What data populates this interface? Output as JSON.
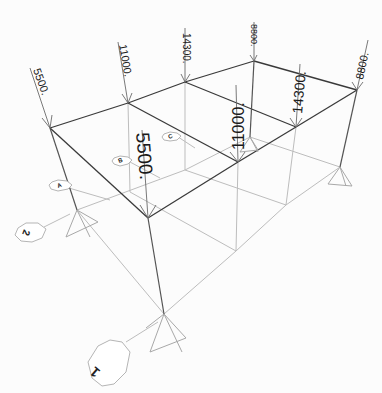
{
  "diagram": {
    "type": "3d-frame-model-loads",
    "roof_loads": [
      {
        "id": "A1",
        "value": "5500.",
        "size": 11
      },
      {
        "id": "B1",
        "value": "11000.",
        "size": 11
      },
      {
        "id": "C1",
        "value": "14300.",
        "size": 10
      },
      {
        "id": "D1",
        "value": "8800.",
        "size": 9
      },
      {
        "id": "A2",
        "value": "5500.",
        "size": 19
      },
      {
        "id": "B2",
        "value": "11000.",
        "size": 16
      },
      {
        "id": "C2",
        "value": "14300.",
        "size": 14
      },
      {
        "id": "D2",
        "value": "8800.",
        "size": 11
      }
    ],
    "grid_bubbles": {
      "letters": [
        "A",
        "B",
        "C"
      ],
      "numbers": [
        "1",
        "2"
      ]
    },
    "colors": {
      "beam": "#3a3a3a",
      "ghost": "#bdbdbd",
      "background": "#fcfcfc"
    }
  }
}
